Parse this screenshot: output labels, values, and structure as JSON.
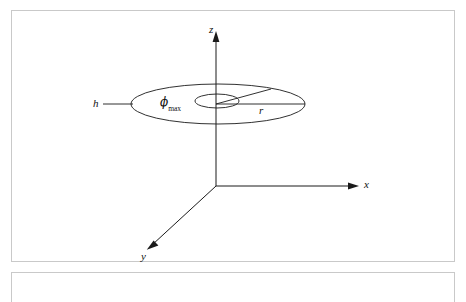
{
  "figure": {
    "type": "diagram",
    "background_color": "#ffffff",
    "frame_color": "#c9c9c9",
    "line_color": "#1a1a1a"
  },
  "axes": {
    "z": {
      "label": "z",
      "direction": "up",
      "arrow": true
    },
    "x": {
      "label": "x",
      "direction": "right",
      "arrow": true
    },
    "y": {
      "label": "y",
      "direction": "down-left",
      "arrow": true
    },
    "origin": {
      "x": 216,
      "y": 186
    }
  },
  "annotations": {
    "height": {
      "label": "h",
      "leader_line": true
    },
    "radius": {
      "label": "r"
    },
    "angle": {
      "symbol": "ϕ",
      "subscript": "max",
      "full": "ϕmax"
    }
  },
  "geometry": {
    "outer_ellipse": {
      "cx": 218,
      "cy": 104,
      "rx": 87,
      "ry": 20
    },
    "inner_ellipse": {
      "cx": 217,
      "cy": 101,
      "rx": 22,
      "ry": 7
    },
    "radius_line_horizontal": {
      "x1": 216,
      "y1": 104,
      "x2": 305,
      "y2": 104
    },
    "radius_line_angled": {
      "x1": 216,
      "y1": 104,
      "x2": 271,
      "y2": 89
    },
    "height_leader": {
      "x1": 103,
      "y1": 104,
      "x2": 132,
      "y2": 104
    }
  },
  "labels": {
    "z": "z",
    "x": "x",
    "y": "y",
    "h": "h",
    "r": "r",
    "phi": "ϕ",
    "phi_sub": "max"
  }
}
